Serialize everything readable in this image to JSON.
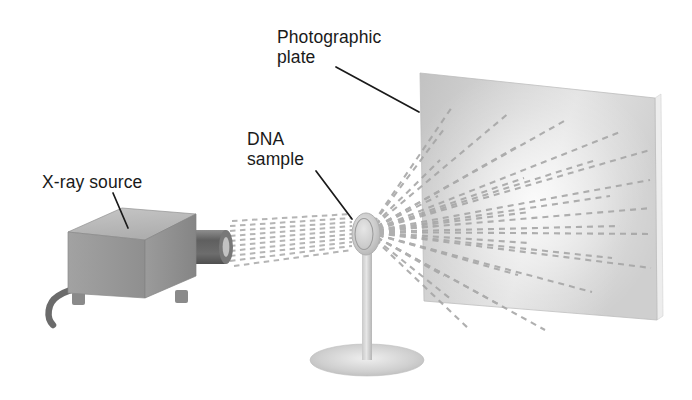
{
  "figure": {
    "background_color": "#ffffff"
  },
  "labels": {
    "photographic_plate": "Photographic\nplate",
    "dna_sample": "DNA\nsample",
    "xray_source": "X-ray source"
  },
  "colors": {
    "label_text": "#1a1a1a",
    "leader_line": "#1a1a1a",
    "box_top": "#b9b9b9",
    "box_front": "#9a9a9a",
    "box_side": "#8d8d8d",
    "tube_dark": "#6e6e6e",
    "cable": "#6b6b6b",
    "plate_face": "#c9c9c9",
    "plate_edge": "#e2e2e2",
    "beam_dash": "#a8a8a8",
    "sample_disc": "#c4c4c4",
    "stand": "#c0c0c0"
  },
  "components": {
    "xray_source_box": "grey rectangular box in perspective with feet",
    "xray_tube": "dark cylindrical collimator tube pointing right",
    "power_cable": "curved cable exiting lower left of box",
    "incident_beam": "bundle of dashed lines from tube to sample",
    "dna_sample_disc": "small translucent oval sample holder",
    "sample_stand": "vertical post on elliptical base",
    "photographic_plate": "large grey plate in perspective at right",
    "diffracted_rays": "dashed rays radiating from sample onto plate"
  }
}
